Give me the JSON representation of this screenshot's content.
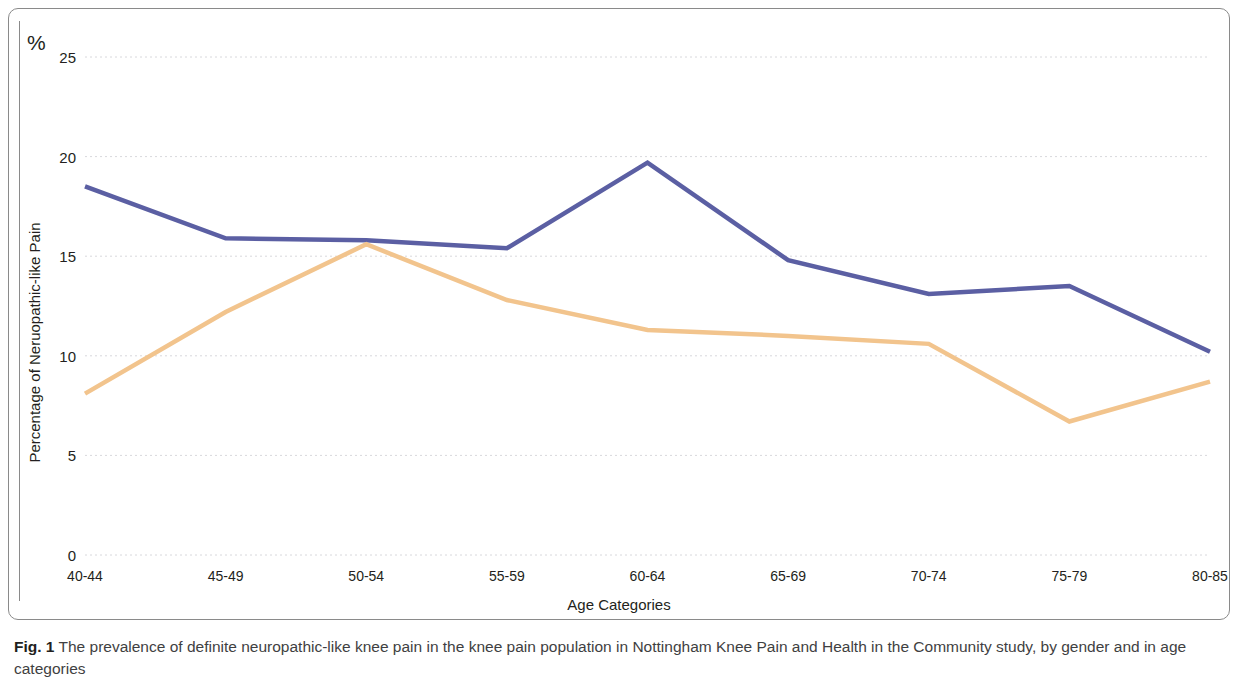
{
  "figure": {
    "percent_symbol": "%",
    "caption_label": "Fig. 1",
    "caption_text": "The prevalence of definite neuropathic-like knee pain in the knee pain population in Nottingham Knee Pain and Health in the Community study, by gender and in age categories"
  },
  "chart_data": {
    "type": "line",
    "title": "",
    "xlabel": "Age Categories",
    "ylabel": "Percentage of Neruopathic-like Pain",
    "categories": [
      "40-44",
      "45-49",
      "50-54",
      "55-59",
      "60-64",
      "65-69",
      "70-74",
      "75-79",
      "80-85"
    ],
    "ylim": [
      0,
      25
    ],
    "yticks": [
      25,
      20,
      15,
      10,
      5,
      0
    ],
    "grid": true,
    "legend": "none",
    "series": [
      {
        "name": "series-blue",
        "color": "#5b5fa3",
        "values": [
          18.5,
          15.9,
          15.8,
          15.4,
          19.7,
          14.8,
          13.1,
          13.5,
          10.2
        ]
      },
      {
        "name": "series-orange",
        "color": "#f2c48d",
        "values": [
          8.1,
          12.2,
          15.6,
          12.8,
          11.3,
          11.0,
          10.6,
          6.7,
          8.7
        ]
      }
    ]
  }
}
